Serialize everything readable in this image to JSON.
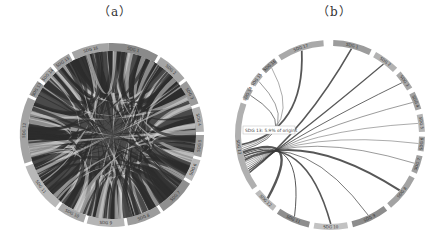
{
  "panels": [
    {
      "id": "a",
      "label": "（a）",
      "center": [
        112,
        135
      ],
      "outer_radius": 92,
      "inner_radius": 84,
      "segment_gap_deg": 2.2,
      "segments": [
        {
          "label": "SDG 1",
          "start": -2,
          "end": 30,
          "shade": "#8a8a8a"
        },
        {
          "label": "SDG 2",
          "start": 32,
          "end": 52,
          "shade": "#a5a5a5"
        },
        {
          "label": "SDG 3",
          "start": 54,
          "end": 70,
          "shade": "#9a9a9a"
        },
        {
          "label": "SDG 4",
          "start": 72,
          "end": 88,
          "shade": "#b0b0b0"
        },
        {
          "label": "SDG 5",
          "start": 90,
          "end": 104,
          "shade": "#a0a0a0"
        },
        {
          "label": "SDG 6",
          "start": 106,
          "end": 120,
          "shade": "#b8b8b8"
        },
        {
          "label": "SDG 7",
          "start": 122,
          "end": 146,
          "shade": "#8f8f8f"
        },
        {
          "label": "SDG 8",
          "start": 148,
          "end": 170,
          "shade": "#9c9c9c"
        },
        {
          "label": "SDG 9",
          "start": 172,
          "end": 196,
          "shade": "#b5b5b5"
        },
        {
          "label": "SDG 10",
          "start": 198,
          "end": 216,
          "shade": "#a8a8a8"
        },
        {
          "label": "SDG 11",
          "start": 218,
          "end": 250,
          "shade": "#b8b8b8"
        },
        {
          "label": "SDG 12",
          "start": 252,
          "end": 294,
          "shade": "#a3a3a3"
        },
        {
          "label": "SDG 13",
          "start": 296,
          "end": 306,
          "shade": "#9a9a9a"
        },
        {
          "label": "SDG 14",
          "start": 308,
          "end": 318,
          "shade": "#a9a9a9"
        },
        {
          "label": "SDG 15",
          "start": 320,
          "end": 332,
          "shade": "#9f9f9f"
        },
        {
          "label": "SDG 16",
          "start": 334,
          "end": 358,
          "shade": "#a4a4a4"
        }
      ],
      "ribbon_color": "#3a3a3a",
      "ribbon_density": "dense"
    },
    {
      "id": "b",
      "label": "（b）",
      "center": [
        330,
        135
      ],
      "outer_radius": 95,
      "inner_radius": 89,
      "segment_gap_deg": 2.5,
      "segments": [
        {
          "label": "SDG 1",
          "start": 2,
          "end": 26,
          "shade": "#9c9c9c"
        },
        {
          "label": "SDG 2",
          "start": 29,
          "end": 45,
          "shade": "#b2b2b2"
        },
        {
          "label": "SDG 3",
          "start": 48,
          "end": 60,
          "shade": "#a8a8a8"
        },
        {
          "label": "SDG 4",
          "start": 63,
          "end": 74,
          "shade": "#a0a0a0"
        },
        {
          "label": "SDG 5",
          "start": 77,
          "end": 88,
          "shade": "#b5b5b5"
        },
        {
          "label": "SDG 6",
          "start": 91,
          "end": 100,
          "shade": "#a6a6a6"
        },
        {
          "label": "SDG 7",
          "start": 103,
          "end": 114,
          "shade": "#9f9f9f"
        },
        {
          "label": "SDG 8",
          "start": 117,
          "end": 140,
          "shade": "#a3a3a3"
        },
        {
          "label": "SDG 9",
          "start": 143,
          "end": 166,
          "shade": "#8d8d8d"
        },
        {
          "label": "SDG 10",
          "start": 169,
          "end": 190,
          "shade": "#c2c2c2"
        },
        {
          "label": "SDG 11",
          "start": 193,
          "end": 214,
          "shade": "#8e8e8e"
        },
        {
          "label": "SDG 12",
          "start": 217,
          "end": 232,
          "shade": "#bbbbbb"
        },
        {
          "label": "SDG 13",
          "start": 235,
          "end": 290,
          "shade": "#b0b0b0"
        },
        {
          "label": "SDG 14",
          "start": 293,
          "end": 300,
          "shade": "#a5a5a5"
        },
        {
          "label": "SDG 15",
          "start": 303,
          "end": 311,
          "shade": "#b3b3b3"
        },
        {
          "label": "SDG 16",
          "start": 314,
          "end": 324,
          "shade": "#999999"
        },
        {
          "label": "SDG 17",
          "start": 327,
          "end": 356,
          "shade": "#a9a9a9"
        }
      ],
      "highlight_source": "SDG 13",
      "tooltip": "SDG 13: 5.9% of origins",
      "tooltip_pos": [
        243,
        126
      ],
      "ribbon_color": "#3a3a3a"
    }
  ]
}
